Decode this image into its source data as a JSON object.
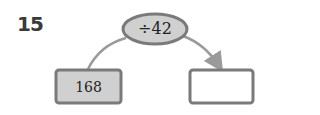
{
  "problem": {
    "number": "15",
    "operation": "÷42",
    "input_value": "168",
    "output_value": ""
  },
  "colors": {
    "border": "#7a7a7a",
    "fill": "#d0d0d0",
    "arrow": "#9a9a9a",
    "text": "#222222"
  }
}
